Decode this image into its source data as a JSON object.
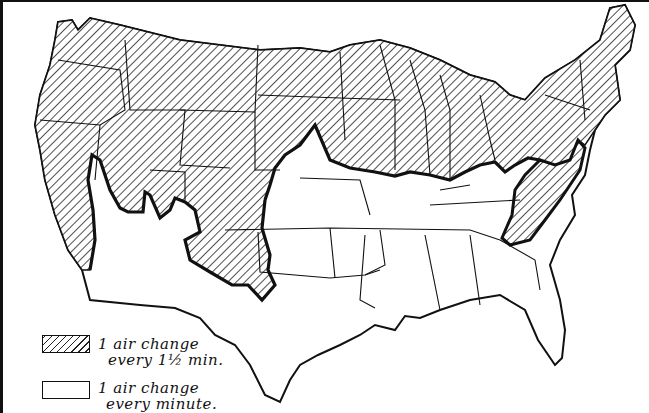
{
  "figure": {
    "type": "map",
    "regions": [
      {
        "id": "north",
        "pattern": "hatched",
        "description": "Northern and western states, plus Appalachian strip"
      },
      {
        "id": "south",
        "pattern": "plain",
        "description": "Southern states and southwest"
      }
    ]
  },
  "legend": {
    "items": [
      {
        "pattern": "hatched",
        "line1": "1 air change",
        "line2": "every 1½ min."
      },
      {
        "pattern": "plain",
        "line1": "1 air change",
        "line2": "every minute."
      }
    ]
  },
  "colors": {
    "ink": "#111111",
    "paper": "#ffffff"
  }
}
